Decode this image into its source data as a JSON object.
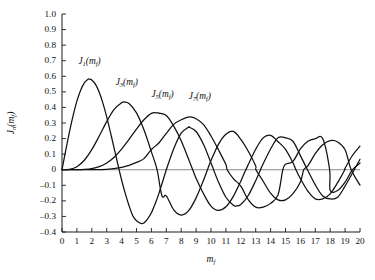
{
  "chart_data": {
    "type": "line",
    "title": "",
    "subtitle": "",
    "xlabel": "m_f",
    "ylabel": "J_n(m_f)",
    "xlim": [
      0,
      20
    ],
    "ylim": [
      -0.4,
      1.0
    ],
    "grid": false,
    "legend_position": "inline-annotations",
    "x_ticks": [
      "0",
      "1",
      "2",
      "3",
      "4",
      "5",
      "6",
      "7",
      "8",
      "9",
      "10",
      "11",
      "12",
      "13",
      "14",
      "15",
      "16",
      "17",
      "18",
      "19",
      "20"
    ],
    "y_ticks": [
      "1.0",
      "0.9",
      "0.8",
      "0.7",
      "0.6",
      "0.5",
      "0.4",
      "0.3",
      "0.2",
      "0.1",
      "0",
      "-0.1",
      "-0.2",
      "-0.3",
      "-0.4"
    ],
    "x_step": 1,
    "y_step": 0.1,
    "zero_reference_line": 0,
    "series": [
      {
        "name": "J1",
        "label": "J",
        "order": "1",
        "argument": "(m",
        "argsub": "f",
        "argclose": ")",
        "color": "#111111",
        "label_x": 1.1,
        "label_y": 0.68,
        "x": [
          0,
          0.25,
          0.5,
          0.75,
          1,
          1.25,
          1.5,
          1.75,
          1.841,
          2,
          2.25,
          2.5,
          2.75,
          3,
          3.25,
          3.5,
          3.832,
          4,
          4.25,
          4.5,
          4.75,
          5,
          5.331,
          5.5,
          5.75,
          6,
          6.25,
          6.5,
          7,
          7.016,
          7.5,
          8,
          8.5,
          8.536,
          9,
          9.5,
          10,
          10.174,
          10.5,
          11,
          11.5,
          11.706,
          12,
          12.5,
          13,
          13.324,
          13.5,
          14,
          14.5,
          15,
          15.5,
          16,
          16.471,
          17,
          17.5,
          18,
          18.5,
          19,
          19.616,
          20
        ],
        "y": [
          0,
          0.124,
          0.2423,
          0.3492,
          0.4401,
          0.5106,
          0.5579,
          0.5802,
          0.5819,
          0.5767,
          0.5484,
          0.4971,
          0.4256,
          0.3391,
          0.2404,
          0.1374,
          0,
          -0.066,
          -0.1538,
          -0.2311,
          -0.2951,
          -0.3276,
          -0.3461,
          -0.3414,
          -0.315,
          -0.2767,
          -0.2196,
          -0.1538,
          0,
          0.0047,
          0.1352,
          0.2346,
          0.2731,
          0.2731,
          0.2453,
          0.1613,
          0.0435,
          0,
          -0.0789,
          -0.1768,
          -0.2284,
          -0.2326,
          -0.2234,
          -0.1655,
          -0.0703,
          0,
          0.038,
          0.1334,
          0.2051,
          0.2051,
          0.1827,
          0.0904,
          0,
          -0.0977,
          -0.1684,
          -0.188,
          -0.1772,
          -0.105,
          0,
          0.067
        ]
      },
      {
        "name": "J3",
        "label": "J",
        "order": "3",
        "argument": "(m",
        "argsub": "f",
        "argclose": ")",
        "color": "#111111",
        "label_x": 3.6,
        "label_y": 0.545,
        "x": [
          0,
          0.5,
          1,
          1.5,
          2,
          2.5,
          3,
          3.5,
          4,
          4.201,
          4.5,
          5,
          5.5,
          6,
          6.38,
          6.706,
          7,
          7.5,
          8,
          8.5,
          9,
          9.5,
          9.761,
          10,
          10.5,
          11,
          11.5,
          12,
          12.5,
          13,
          13.015,
          13.5,
          14,
          14.5,
          15,
          15.5,
          16,
          16.223,
          16.5,
          17,
          17.5,
          18,
          18.5,
          19,
          19.409,
          20
        ],
        "y": [
          0,
          0.0026,
          0.0196,
          0.061,
          0.1289,
          0.2166,
          0.3091,
          0.3868,
          0.4302,
          0.4345,
          0.4247,
          0.3648,
          0.2561,
          0.1148,
          0,
          -0.1676,
          -0.1676,
          -0.258,
          -0.2911,
          -0.2633,
          -0.1809,
          -0.067,
          0,
          0.0584,
          0.1628,
          0.2273,
          0.2458,
          0.1951,
          0.1184,
          0.0233,
          0,
          -0.074,
          -0.1508,
          -0.194,
          -0.194,
          -0.154,
          -0.079,
          0,
          0.025,
          0.1031,
          0.16,
          0.1863,
          0.1782,
          0.128,
          0,
          -0.0989
        ]
      },
      {
        "name": "J5",
        "label": "J",
        "order": "5",
        "argument": "(m",
        "argsub": "f",
        "argclose": ")",
        "color": "#111111",
        "label_x": 6.0,
        "label_y": 0.465,
        "x": [
          0,
          1,
          1.5,
          2,
          2.5,
          3,
          3.5,
          4,
          4.5,
          5,
          5.5,
          6,
          6.415,
          6.5,
          7,
          7.5,
          8,
          8.771,
          9,
          9.5,
          10,
          10.5,
          11,
          11.5,
          12,
          12.339,
          12.5,
          13,
          13.5,
          14,
          14.5,
          15,
          15.5,
          15.7,
          16,
          16.5,
          17,
          17.5,
          18,
          18.5,
          18.98,
          19,
          19.5,
          20
        ],
        "y": [
          0,
          0.0002,
          0.0018,
          0.007,
          0.0195,
          0.043,
          0.0804,
          0.1321,
          0.1947,
          0.2611,
          0.3209,
          0.3621,
          0.3647,
          0.3632,
          0.3479,
          0.28,
          0.1858,
          0,
          -0.055,
          -0.1548,
          -0.234,
          -0.2614,
          -0.2383,
          -0.1712,
          -0.0735,
          0,
          0.033,
          0.1316,
          0.2043,
          0.2204,
          0.1801,
          0.1305,
          0.0451,
          0,
          -0.0575,
          -0.1375,
          -0.187,
          -0.187,
          -0.1554,
          -0.0828,
          0,
          0.0096,
          0.093,
          0.1512
        ]
      },
      {
        "name": "J7",
        "label": "J",
        "order": "7",
        "argument": "(m",
        "argsub": "f",
        "argclose": ")",
        "color": "#111111",
        "label_x": 8.5,
        "label_y": 0.455,
        "x": [
          0,
          2,
          3,
          4,
          4.5,
          5,
          5.5,
          6,
          6.5,
          7,
          7.5,
          8,
          8.578,
          9,
          9.5,
          10,
          10.5,
          11,
          11.5,
          11.086,
          12,
          12.5,
          13,
          13.5,
          14,
          14.5,
          14.821,
          15,
          15.5,
          16,
          16.5,
          17,
          17.5,
          17.96,
          18,
          18.5,
          19,
          19.5,
          20
        ],
        "y": [
          0,
          0.0002,
          0.0026,
          0.0152,
          0.0283,
          0.0468,
          0.0712,
          0.1296,
          0.1718,
          0.2336,
          0.2911,
          0.3206,
          0.3392,
          0.3275,
          0.2894,
          0.2167,
          0.128,
          0.0334,
          -0.057,
          0,
          -0.1054,
          -0.1925,
          -0.2406,
          -0.2406,
          -0.2161,
          -0.1615,
          0,
          0.0345,
          0.0538,
          0.1334,
          0.1834,
          0.1989,
          0.1989,
          0,
          -0.1334,
          -0.1334,
          -0.0791,
          0,
          0.043
        ]
      }
    ]
  }
}
